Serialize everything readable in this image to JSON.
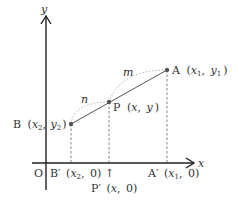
{
  "colors": {
    "axis": "#222222",
    "segment": "#555555",
    "dashed": "#777777",
    "arc": "#aaaaaa",
    "point": "#555555",
    "text": "#333333"
  },
  "axes": {
    "x_label": "x",
    "y_label": "y",
    "origin_label": "O"
  },
  "points": {
    "A": {
      "name": "A",
      "coord_x": "x",
      "coord_x_sub": "1",
      "coord_y": "y",
      "coord_y_sub": "1"
    },
    "B": {
      "name": "B",
      "coord_x": "x",
      "coord_x_sub": "2",
      "coord_y": "y",
      "coord_y_sub": "2"
    },
    "P": {
      "name": "P",
      "coord_x": "x",
      "coord_y": "y"
    }
  },
  "projections": {
    "A_prime": {
      "name": "A′",
      "coord_x": "x",
      "coord_x_sub": "1",
      "coord_y": "0"
    },
    "B_prime": {
      "name": "B′",
      "coord_x": "x",
      "coord_x_sub": "2",
      "coord_y": "0"
    },
    "P_prime": {
      "name": "P′",
      "coord_x": "x",
      "coord_y": "0"
    }
  },
  "ratio_labels": {
    "m": "m",
    "n": "n"
  },
  "arrow_glyph": "↑",
  "punct": {
    "open": "(",
    "close": ")",
    "comma": ","
  }
}
